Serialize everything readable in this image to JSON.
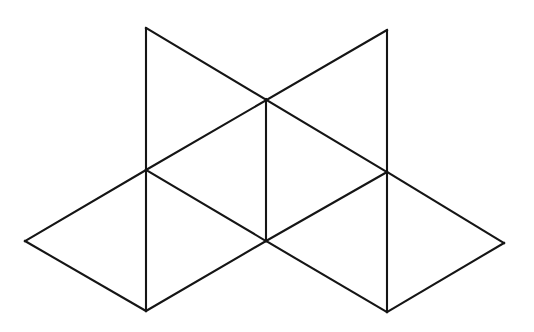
{
  "figure": {
    "background_color": "#ffffff",
    "stroke_color": "#151515",
    "stroke_width": 2.1,
    "canvas": {
      "width": 534,
      "height": 332
    },
    "vertices": [
      {
        "id": "top-left",
        "label": "A",
        "x": 146,
        "y": 28
      },
      {
        "id": "top-right",
        "label": "B",
        "x": 387,
        "y": 30
      },
      {
        "id": "center-upper",
        "label": "C",
        "x": 266,
        "y": 99
      },
      {
        "id": "left-middle",
        "label": "D",
        "x": 146,
        "y": 170
      },
      {
        "id": "right-middle",
        "label": "E",
        "x": 387,
        "y": 172
      },
      {
        "id": "far-left",
        "label": "F",
        "x": 25,
        "y": 241
      },
      {
        "id": "center-lower",
        "label": "G",
        "x": 266,
        "y": 241
      },
      {
        "id": "far-right",
        "label": "H",
        "x": 504,
        "y": 243
      },
      {
        "id": "bottom-left",
        "label": "I",
        "x": 146,
        "y": 311
      },
      {
        "id": "bottom-right",
        "label": "J",
        "x": 387,
        "y": 312
      }
    ],
    "edges": [
      {
        "id": "edge-left-vertical",
        "name": "left-vertical-edge",
        "from": "top-left",
        "to": "bottom-left",
        "x1": 146,
        "y1": 28,
        "x2": 146,
        "y2": 311
      },
      {
        "id": "edge-right-vertical",
        "name": "right-vertical-edge",
        "from": "top-right",
        "to": "bottom-right",
        "x1": 387,
        "y1": 30,
        "x2": 387,
        "y2": 312
      },
      {
        "id": "edge-center-vertical",
        "name": "center-vertical-edge",
        "from": "center-upper",
        "to": "center-lower",
        "x1": 266,
        "y1": 99,
        "x2": 266,
        "y2": 241
      },
      {
        "id": "edge-diag-tl-rm",
        "name": "diagonal-topleft-rightmiddle",
        "from": "top-left",
        "to": "right-middle",
        "x1": 146,
        "y1": 28,
        "x2": 387,
        "y2": 172
      },
      {
        "id": "edge-diag-tr-lm",
        "name": "diagonal-topright-leftmiddle",
        "from": "top-right",
        "to": "left-middle",
        "x1": 387,
        "y1": 30,
        "x2": 146,
        "y2": 170
      },
      {
        "id": "edge-lm-fl",
        "name": "edge-leftmiddle-farleft",
        "from": "left-middle",
        "to": "far-left",
        "x1": 146,
        "y1": 170,
        "x2": 25,
        "y2": 241
      },
      {
        "id": "edge-fl-bl",
        "name": "edge-farleft-bottomleft",
        "from": "far-left",
        "to": "bottom-left",
        "x1": 25,
        "y1": 241,
        "x2": 146,
        "y2": 311
      },
      {
        "id": "edge-lm-cl",
        "name": "edge-leftmiddle-centerlower",
        "from": "left-middle",
        "to": "center-lower",
        "x1": 146,
        "y1": 170,
        "x2": 266,
        "y2": 241
      },
      {
        "id": "edge-cl-bl",
        "name": "edge-centerlower-bottomleft",
        "from": "center-lower",
        "to": "bottom-left",
        "x1": 266,
        "y1": 241,
        "x2": 146,
        "y2": 311
      },
      {
        "id": "edge-cl-rm",
        "name": "edge-centerlower-rightmiddle",
        "from": "center-lower",
        "to": "right-middle",
        "x1": 266,
        "y1": 241,
        "x2": 387,
        "y2": 172
      },
      {
        "id": "edge-cl-br",
        "name": "edge-centerlower-bottomright",
        "from": "center-lower",
        "to": "bottom-right",
        "x1": 266,
        "y1": 241,
        "x2": 387,
        "y2": 312
      },
      {
        "id": "edge-rm-fr",
        "name": "edge-rightmiddle-farright",
        "from": "right-middle",
        "to": "far-right",
        "x1": 387,
        "y1": 172,
        "x2": 504,
        "y2": 243
      },
      {
        "id": "edge-fr-br",
        "name": "edge-farright-bottomright",
        "from": "far-right",
        "to": "bottom-right",
        "x1": 504,
        "y1": 243,
        "x2": 387,
        "y2": 312
      }
    ]
  }
}
